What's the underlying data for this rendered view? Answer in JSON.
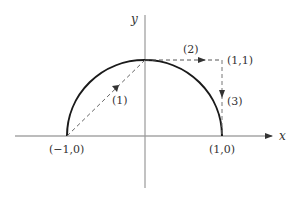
{
  "diagram": {
    "axes": {
      "x_label": "x",
      "y_label": "y"
    },
    "curve": {
      "type": "upper-semicircle",
      "center": [
        0,
        0
      ],
      "radius": 1,
      "stroke": "#1a1a1a"
    },
    "points": [
      {
        "label": "(−1,0)",
        "coords": [
          -1,
          0
        ]
      },
      {
        "label": "(1,0)",
        "coords": [
          1,
          0
        ]
      },
      {
        "label": "(1,1)",
        "coords": [
          1,
          1
        ]
      }
    ],
    "paths": [
      {
        "label": "(1)",
        "from": [
          -1,
          0
        ],
        "to": [
          0,
          1
        ],
        "style": "dashed-arrow"
      },
      {
        "label": "(2)",
        "from": [
          0,
          1
        ],
        "to": [
          1,
          1
        ],
        "style": "dashed-arrow"
      },
      {
        "label": "(3)",
        "from": [
          1,
          1
        ],
        "to": [
          1,
          0
        ],
        "style": "dashed-arrow"
      }
    ],
    "colors": {
      "axis": "#7a7a7a",
      "curve": "#1a1a1a",
      "dashed": "#555555",
      "text": "#333333"
    }
  }
}
